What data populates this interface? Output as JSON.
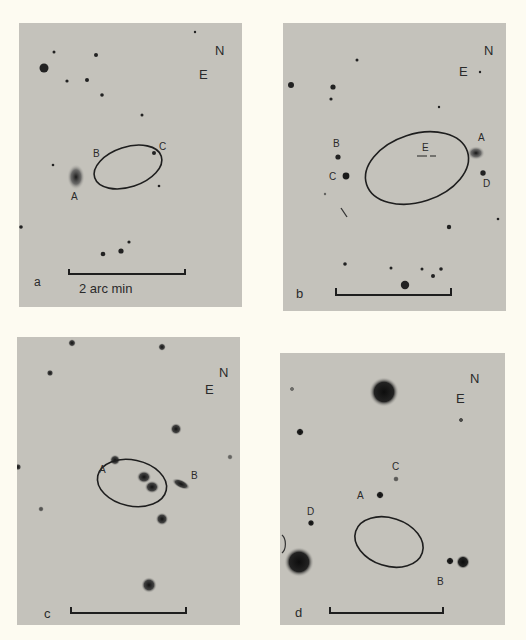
{
  "figure": {
    "background": "#fdfbf1",
    "plate_color": "#c4c2bb",
    "ink_color": "#1e1e1e",
    "panels": [
      {
        "id": "a",
        "panel_label": "a",
        "orientation": {
          "north": "N",
          "east": "E"
        },
        "scale_bar_label": "2 arc min",
        "object_labels": [
          "A",
          "B",
          "C"
        ]
      },
      {
        "id": "b",
        "panel_label": "b",
        "orientation": {
          "north": "N",
          "east": "E"
        },
        "scale_bar_label": "",
        "object_labels": [
          "A",
          "B",
          "C",
          "D",
          "E"
        ]
      },
      {
        "id": "c",
        "panel_label": "c",
        "orientation": {
          "north": "N",
          "east": "E"
        },
        "scale_bar_label": "",
        "object_labels": [
          "A",
          "B"
        ]
      },
      {
        "id": "d",
        "panel_label": "d",
        "orientation": {
          "north": "N",
          "east": "E"
        },
        "scale_bar_label": "",
        "object_labels": [
          "A",
          "B",
          "C",
          "D"
        ]
      }
    ]
  }
}
